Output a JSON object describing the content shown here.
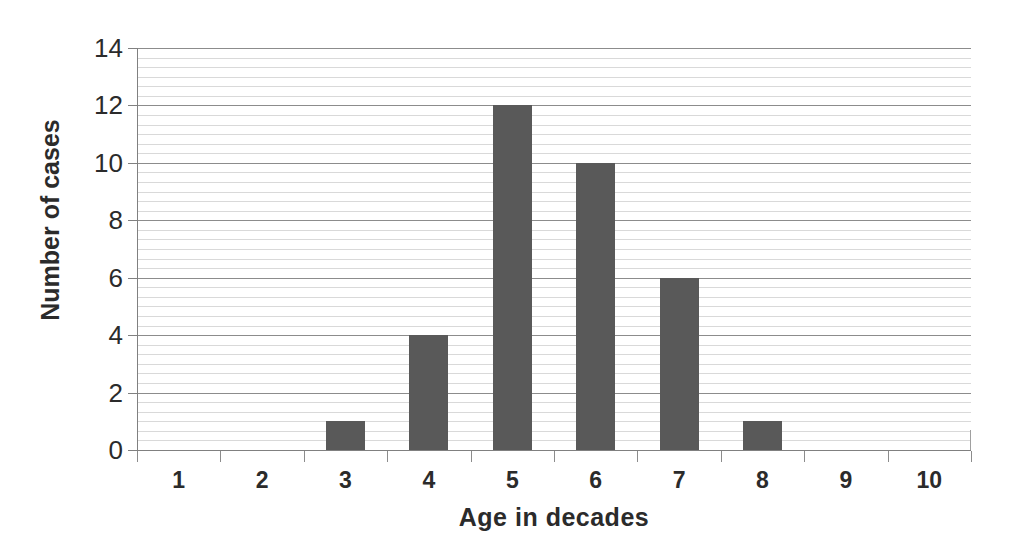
{
  "chart_data": {
    "type": "bar",
    "title": "",
    "xlabel": "Age in decades",
    "ylabel": "Number of cases",
    "categories": [
      "1",
      "2",
      "3",
      "4",
      "5",
      "6",
      "7",
      "8",
      "9",
      "10"
    ],
    "values": [
      0,
      0,
      1,
      4,
      12,
      10,
      6,
      1,
      0,
      0
    ],
    "ylim": [
      0,
      14
    ],
    "y_ticks": [
      0,
      2,
      4,
      6,
      8,
      10,
      12,
      14
    ],
    "y_tick_labels": [
      "0",
      "2",
      "4",
      "6",
      "8",
      "10",
      "12",
      "14"
    ],
    "y_major_step": 2,
    "y_minor_step": 0.3333333,
    "grid": true,
    "grid_axis": "y",
    "legend": null,
    "legend_position": "none",
    "series": [
      {
        "name": "Number of cases",
        "values": [
          0,
          0,
          1,
          4,
          12,
          10,
          6,
          1,
          0,
          0
        ]
      }
    ]
  },
  "style": {
    "bar_color": "#595959",
    "major_gridline_color": "#8c8c8c",
    "minor_gridline_color": "#d9d9d9",
    "axis_color": "#808080",
    "text_color": "#2b2b2b",
    "background": "#ffffff"
  }
}
